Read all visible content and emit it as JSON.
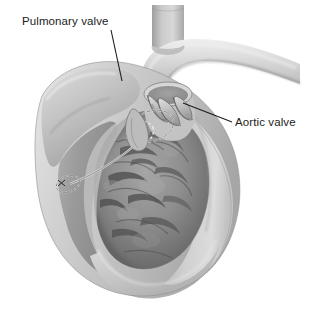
{
  "figure": {
    "kind": "anatomical-illustration",
    "style": "grayscale medical drawing",
    "background_color": "#ffffff"
  },
  "labels": [
    {
      "id": "pulmonary",
      "text": "Pulmonary valve",
      "x": 22,
      "y": 15,
      "leader": {
        "x1": 111,
        "y1": 30,
        "x2": 122,
        "y2": 81
      }
    },
    {
      "id": "aortic",
      "text": "Aortic valve",
      "x": 235,
      "y": 116,
      "leader": {
        "x1": 232,
        "y1": 122,
        "x2": 183,
        "y2": 103
      }
    }
  ],
  "colors": {
    "line": "#1c1c1c",
    "text": "#1c1c1c",
    "background": "#ffffff",
    "wall_light": "#d2d2d2",
    "wall_mid": "#b4b4b4",
    "wall_edge": "#8f8f8f",
    "cavity_mid": "#9a9a9a",
    "cavity_dark": "#6a6a6a",
    "cavity_deep": "#575757",
    "vessel_light": "#c9c9c9",
    "vessel_dark": "#7d7d7d",
    "lumen_dark": "#4e4e4e",
    "valve_cusp": "#bdbdbd",
    "outline": "#5c5c5c"
  },
  "structures": [
    {
      "name": "aortic-arch",
      "description": "great vessel arching to upper right"
    },
    {
      "name": "brachiocephalic-branch",
      "description": "vertical vessel branch at top"
    },
    {
      "name": "pulmonary-trunk",
      "description": "cut cylindrical vessel at upper left"
    },
    {
      "name": "pulmonary-valve",
      "description": "semilunar valve in pulmonary trunk"
    },
    {
      "name": "aortic-valve",
      "description": "semilunar valve cusps in aortic root"
    },
    {
      "name": "left-ventricle-cavity",
      "description": "large dark chamber with trabeculae carneae"
    },
    {
      "name": "myocardium-wall",
      "description": "thick pale muscular wall, cut open"
    },
    {
      "name": "interventricular-septum",
      "description": "wall ridge at left of cavity"
    },
    {
      "name": "trabeculae-carneae",
      "description": "muscular ridges lining ventricle"
    },
    {
      "name": "valve-annulus-dashed",
      "description": "dashed circular outline marking valve ring"
    },
    {
      "name": "apex",
      "description": "rounded inferior tip of heart"
    }
  ]
}
